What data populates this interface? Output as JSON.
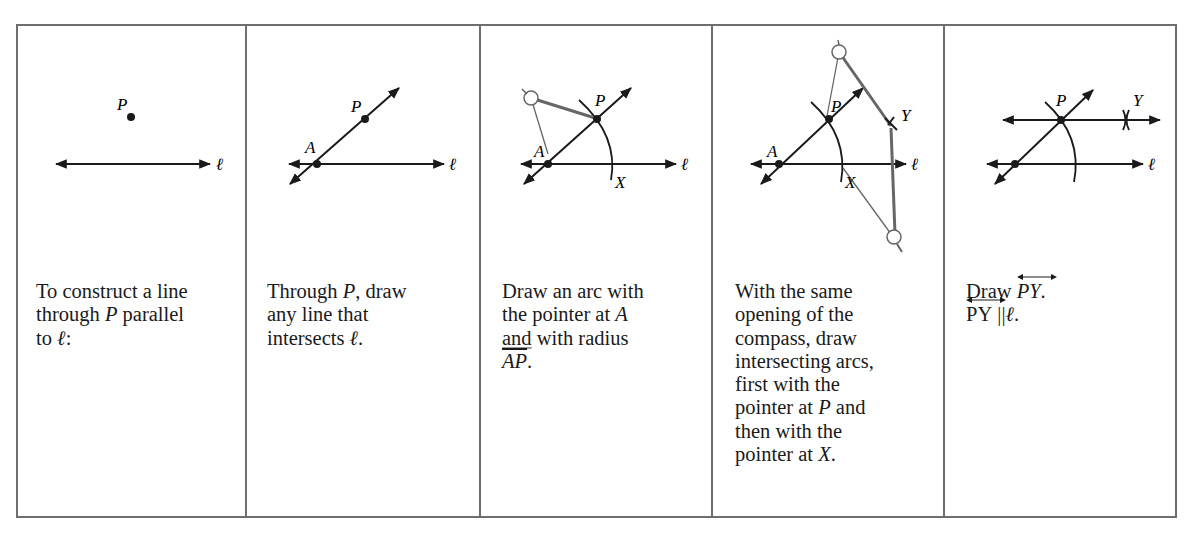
{
  "figure": {
    "colors": {
      "border": "#6e6e6e",
      "ink": "#1a1a1a",
      "compass": "#666666"
    },
    "panels": [
      {
        "step": 1,
        "labels": {
          "P": "P",
          "line": "ℓ"
        },
        "caption": {
          "l1": "To construct a line",
          "l2a": "through ",
          "l2P": "P",
          "l2b": " parallel",
          "l3a": "to ",
          "l3l": "ℓ",
          "l3b": ":"
        }
      },
      {
        "step": 2,
        "labels": {
          "P": "P",
          "A": "A",
          "line": "ℓ"
        },
        "caption": {
          "l1a": "Through ",
          "l1P": "P",
          "l1b": ", draw",
          "l2": "any line that",
          "l3a": "intersects ",
          "l3l": "ℓ",
          "l3b": "."
        }
      },
      {
        "step": 3,
        "labels": {
          "P": "P",
          "A": "A",
          "X": "X",
          "line": "ℓ"
        },
        "caption": {
          "l1": "Draw an arc with",
          "l2a": "the pointer at ",
          "l2A": "A",
          "l3a": "and",
          "l3b": " with radius",
          "l4seg": "AP",
          "l4b": "."
        }
      },
      {
        "step": 4,
        "labels": {
          "P": "P",
          "A": "A",
          "X": "X",
          "Y": "Y",
          "line": "ℓ"
        },
        "caption": {
          "l1": "With the same",
          "l2": "opening of the",
          "l3": "compass, draw",
          "l4": "intersecting arcs,",
          "l5": "first with the",
          "l6a": "pointer at ",
          "l6P": "P",
          "l6b": " and",
          "l7": "then with the",
          "l8a": "pointer at ",
          "l8X": "X",
          "l8b": "."
        }
      },
      {
        "step": 5,
        "labels": {
          "P": "P",
          "Y": "Y",
          "line": "ℓ"
        },
        "caption": {
          "l1a": "Draw ",
          "l1ray": "PY",
          "l1b": ".",
          "l2ray": "PY",
          "l2par": "||",
          "l2l": "ℓ",
          "l2b": "."
        }
      }
    ]
  }
}
